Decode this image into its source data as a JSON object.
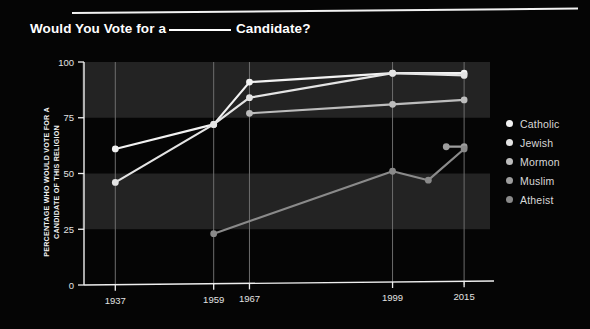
{
  "header": {
    "title_before": "Would You Vote for a",
    "title_blank": "______",
    "title_after": "Candidate?"
  },
  "axis": {
    "y_caption_line1": "PERCENTAGE WHO WOULD VOTE FOR A",
    "y_caption_line2": "CANDIDATE OF THIS RELIGION"
  },
  "legend": {
    "items": [
      {
        "label": "Catholic",
        "color": "#f2f2f2"
      },
      {
        "label": "Jewish",
        "color": "#e4e4e4"
      },
      {
        "label": "Mormon",
        "color": "#bdbdbd"
      },
      {
        "label": "Muslim",
        "color": "#9e9e9e"
      },
      {
        "label": "Atheist",
        "color": "#8a8a8a"
      }
    ]
  },
  "chart_data": {
    "type": "line",
    "xlabel": "",
    "ylabel": "PERCENTAGE WHO WOULD VOTE FOR A CANDIDATE OF THIS RELIGION",
    "ylim": [
      0,
      100
    ],
    "yticks": [
      0,
      25,
      50,
      75,
      100
    ],
    "xticks": [
      1937,
      1959,
      1967,
      1999,
      2015
    ],
    "xtick_labels": [
      "1937",
      "1959",
      "1967",
      "1999",
      "2015"
    ],
    "xlim": [
      1930,
      2019
    ],
    "grid": "horizontal-bands",
    "legend_position": "right",
    "series": [
      {
        "name": "Catholic",
        "color": "#f2f2f2",
        "points": [
          {
            "x": 1937,
            "y": 61
          },
          {
            "x": 1959,
            "y": 72
          },
          {
            "x": 1967,
            "y": 91
          },
          {
            "x": 1999,
            "y": 95
          },
          {
            "x": 2015,
            "y": 95
          }
        ]
      },
      {
        "name": "Jewish",
        "color": "#e4e4e4",
        "points": [
          {
            "x": 1937,
            "y": 46
          },
          {
            "x": 1959,
            "y": 72
          },
          {
            "x": 1967,
            "y": 84
          },
          {
            "x": 1999,
            "y": 95
          },
          {
            "x": 2015,
            "y": 94
          }
        ]
      },
      {
        "name": "Mormon",
        "color": "#bdbdbd",
        "points": [
          {
            "x": 1967,
            "y": 77
          },
          {
            "x": 1999,
            "y": 81
          },
          {
            "x": 2015,
            "y": 83
          }
        ]
      },
      {
        "name": "Muslim",
        "color": "#9e9e9e",
        "points": [
          {
            "x": 2011,
            "y": 62
          },
          {
            "x": 2015,
            "y": 62
          }
        ]
      },
      {
        "name": "Atheist",
        "color": "#8a8a8a",
        "points": [
          {
            "x": 1959,
            "y": 23
          },
          {
            "x": 1999,
            "y": 51
          },
          {
            "x": 2007,
            "y": 47
          },
          {
            "x": 2015,
            "y": 61
          }
        ]
      }
    ],
    "bands": [
      {
        "from": 75,
        "to": 100
      },
      {
        "from": 25,
        "to": 50
      }
    ]
  }
}
